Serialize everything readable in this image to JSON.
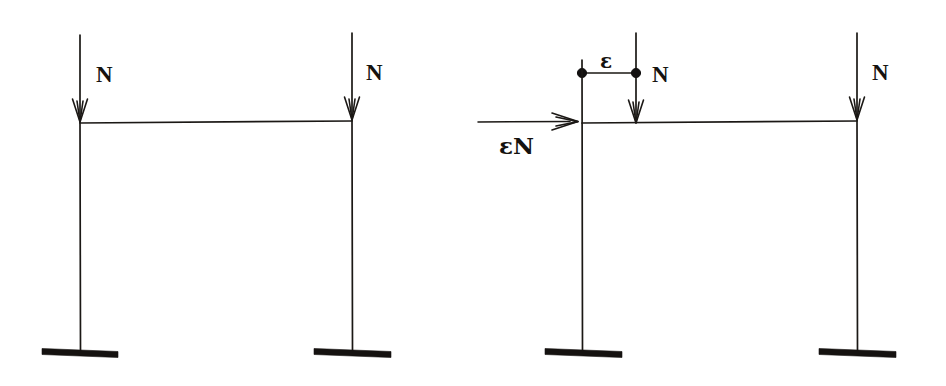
{
  "figure": {
    "background_color": "#ffffff",
    "ink_color": "#1b1815",
    "width": 946,
    "height": 386
  },
  "frames": [
    {
      "id": "left-frame",
      "name": "concentric-load-frame",
      "description": "Portal frame with two axial loads N applied concentrically at the column tops",
      "beam": {
        "x1": 80,
        "y1": 123,
        "x2": 352,
        "y2": 121
      },
      "columns": [
        {
          "name": "left-column",
          "x": 80,
          "y_top": 121,
          "y_bottom": 351
        },
        {
          "name": "right-column",
          "x": 352,
          "y_top": 119,
          "y_bottom": 351
        }
      ],
      "loads": [
        {
          "name": "left-load",
          "label": "N",
          "x": 80,
          "y_start": 35,
          "y_end": 121,
          "label_x": 96,
          "label_y": 82
        },
        {
          "name": "right-load",
          "label": "N",
          "x": 352,
          "y_start": 33,
          "y_end": 119,
          "label_x": 366,
          "label_y": 80
        }
      ],
      "supports": [
        {
          "name": "left-base-plate",
          "cx": 80,
          "cy": 352,
          "half_width": 38
        },
        {
          "name": "right-base-plate",
          "cx": 352,
          "cy": 352,
          "half_width": 38
        }
      ]
    },
    {
      "id": "right-frame",
      "name": "eccentric-load-frame",
      "description": "Portal frame with the left load N offset by eccentricity epsilon, producing an equivalent horizontal force epsilon N at beam level",
      "beam": {
        "x1": 582,
        "y1": 123,
        "x2": 857,
        "y2": 121
      },
      "columns": [
        {
          "name": "left-column",
          "x": 582,
          "y_top": 60,
          "y_bottom": 351
        },
        {
          "name": "right-column",
          "x": 857,
          "y_top": 119,
          "y_bottom": 351
        }
      ],
      "loads": [
        {
          "name": "eccentric-load",
          "label": "N",
          "x": 636,
          "y_start": 33,
          "y_end": 122,
          "label_x": 652,
          "label_y": 82
        },
        {
          "name": "right-load",
          "label": "N",
          "x": 857,
          "y_start": 33,
          "y_end": 119,
          "label_x": 872,
          "label_y": 80
        }
      ],
      "eccentricity": {
        "name": "eccentricity-offset",
        "label": "ε",
        "label_x": 604,
        "label_y": 68,
        "line": {
          "x1": 582,
          "y1": 73,
          "x2": 636,
          "y2": 73
        },
        "dots": [
          {
            "name": "column-axis-node",
            "cx": 582,
            "cy": 73,
            "r": 4.6
          },
          {
            "name": "load-application-node",
            "cx": 636,
            "cy": 73,
            "r": 4.6
          }
        ]
      },
      "horizontal_force": {
        "name": "equivalent-horizontal-force",
        "label": "εN",
        "label_x": 499,
        "label_y": 154,
        "line": {
          "x1": 478,
          "y1": 122,
          "x2": 578,
          "y2": 121
        }
      },
      "supports": [
        {
          "name": "left-base-plate",
          "cx": 582,
          "cy": 352,
          "half_width": 38
        },
        {
          "name": "right-base-plate",
          "cx": 857,
          "cy": 352,
          "half_width": 38
        }
      ]
    }
  ],
  "labels": {
    "axial_load": "N",
    "eccentricity": "ε",
    "equivalent_force": "εN"
  }
}
